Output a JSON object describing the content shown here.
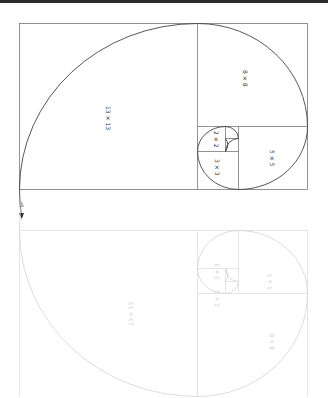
{
  "diagram": {
    "labels": {
      "sq13": "13 × 13",
      "sq8": "8 × 8",
      "sq5": "5 × 5",
      "sq3": "3 × 3",
      "sq2": "2 × 2"
    },
    "reflection_labels": {
      "sq13": "13 × 13",
      "sq8": "8 × 8",
      "sq5": "5 × 5",
      "sq3": "3 × 3",
      "sq2": "2 × 2"
    },
    "colors": {
      "line": "#555555",
      "spiral": "#444444",
      "reflection": "#d6d6d6",
      "topbar": "#2a2a2a"
    }
  }
}
